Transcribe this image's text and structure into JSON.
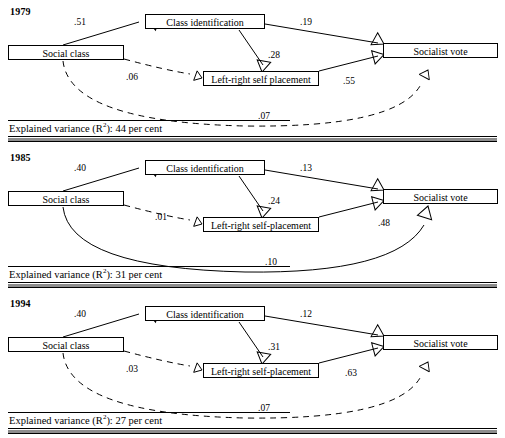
{
  "figure": {
    "type": "path-diagram",
    "node_labels": {
      "social_class": "Social class",
      "class_identification": "Class identification",
      "left_right_1979": "Left-right self placement",
      "left_right_1985": "Left-right self-placement",
      "socialist_vote": "Socialist vote"
    },
    "variance_prefix": "Explained variance (R",
    "variance_sup": "2",
    "variance_middle": "): ",
    "variance_suffix": " per cent"
  },
  "panels": [
    {
      "year": "1979",
      "nodes": {
        "social": "Social class",
        "classid": "Class identification",
        "leftright": "Left-right self placement",
        "vote": "Socialist vote"
      },
      "coefficients": {
        "social_to_classid": ".51",
        "classid_to_vote": ".19",
        "classid_to_leftright": ".28",
        "social_to_leftright": ".06",
        "leftright_to_vote": ".55",
        "social_to_vote": ".07"
      },
      "edge_styles": {
        "social_to_classid": "solid",
        "classid_to_vote": "solid",
        "classid_to_leftright": "solid",
        "social_to_leftright": "dashed",
        "leftright_to_vote": "solid",
        "social_to_vote": "dashed"
      },
      "explained_variance": "Explained variance (R2): 44 per cent",
      "explained_variance_value": "44"
    },
    {
      "year": "1985",
      "nodes": {
        "social": "Social class",
        "classid": "Class identification",
        "leftright": "Left-right self-placement",
        "vote": "Socialist vote"
      },
      "coefficients": {
        "social_to_classid": ".40",
        "classid_to_vote": ".13",
        "classid_to_leftright": ".24",
        "social_to_leftright": ".01",
        "leftright_to_vote": ".48",
        "social_to_vote": ".10"
      },
      "edge_styles": {
        "social_to_classid": "solid",
        "classid_to_vote": "solid",
        "classid_to_leftright": "solid",
        "social_to_leftright": "dashed",
        "leftright_to_vote": "solid",
        "social_to_vote": "solid"
      },
      "explained_variance": "Explained variance (R2): 31 per cent",
      "explained_variance_value": "31"
    },
    {
      "year": "1994",
      "nodes": {
        "social": "Social class",
        "classid": "Class identification",
        "leftright": "Left-right self-placement",
        "vote": "Socialist vote"
      },
      "coefficients": {
        "social_to_classid": ".40",
        "classid_to_vote": ".12",
        "classid_to_leftright": ".31",
        "social_to_leftright": ".03",
        "leftright_to_vote": ".63",
        "social_to_vote": ".07"
      },
      "edge_styles": {
        "social_to_classid": "solid",
        "classid_to_vote": "solid",
        "classid_to_leftright": "solid",
        "social_to_leftright": "dashed",
        "leftright_to_vote": "solid",
        "social_to_vote": "dashed"
      },
      "explained_variance": "Explained variance (R2): 27 per cent",
      "explained_variance_value": "27"
    }
  ],
  "colors": {
    "line": "#000000",
    "rule_gray": "#8d8d8d",
    "background": "#ffffff"
  }
}
